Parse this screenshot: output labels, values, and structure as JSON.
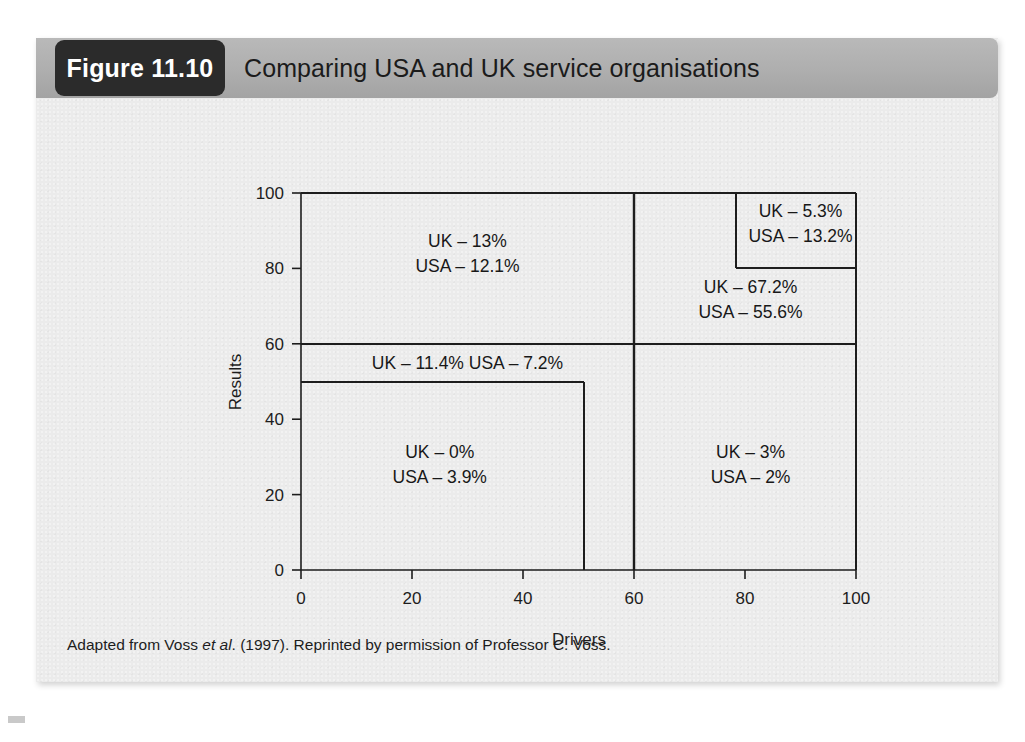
{
  "figure": {
    "tag": "Figure 11.10",
    "title": "Comparing USA and UK service organisations",
    "source_note_prefix": "Adapted from Voss ",
    "source_note_italic": "et al",
    "source_note_suffix": ". (1997). Reprinted by permission of Professor C. Voss."
  },
  "colors": {
    "card_background": "#ebebeb",
    "header_band": "#aeaeae",
    "tag_background": "#2b2b2b",
    "tag_text": "#ffffff",
    "line": "#1d1d1d",
    "text": "#1d1d1d",
    "page_background": "#ffffff"
  },
  "chart_data": {
    "type": "table",
    "title": "Comparing USA and UK service organisations",
    "xlabel": "Drivers",
    "ylabel": "Results",
    "xlim": [
      0,
      100
    ],
    "ylim": [
      0,
      100
    ],
    "xticks": [
      "0",
      "20",
      "40",
      "60",
      "80",
      "100"
    ],
    "yticks": [
      "0",
      "20",
      "40",
      "60",
      "80",
      "100"
    ],
    "xtick_values": [
      0,
      20,
      40,
      60,
      80,
      100
    ],
    "ytick_values": [
      0,
      20,
      40,
      60,
      80,
      100
    ],
    "grid": false,
    "legend": "none",
    "series": [
      {
        "name": "UK",
        "values": [
          13,
          5.3,
          67.2,
          11.4,
          0,
          3
        ]
      },
      {
        "name": "USA",
        "values": [
          12.1,
          13.2,
          55.6,
          7.2,
          3.9,
          2
        ]
      }
    ],
    "categories": [
      "Low drivers / high results",
      "High drivers / very high results (inner box)",
      "High drivers / high results",
      "Mid band (results 50-60)",
      "Low drivers / low results",
      "High drivers / low results"
    ],
    "regions": [
      {
        "id": "top-left",
        "x0": 0,
        "x1": 60,
        "y0": 60,
        "y1": 100,
        "line1": "UK – 13%",
        "line2": "USA – 12.1%",
        "uk": 13,
        "usa": 12.1,
        "label_x": 30,
        "label_y": 84
      },
      {
        "id": "top-right-inner",
        "x0": 80,
        "x1": 100,
        "y0": 80,
        "y1": 100,
        "line1": "UK – 5.3%",
        "line2": "USA – 13.2%",
        "uk": 5.3,
        "usa": 13.2,
        "label_x": 90,
        "label_y": 92
      },
      {
        "id": "top-right-outer",
        "x0": 60,
        "x1": 100,
        "y0": 60,
        "y1": 100,
        "line1": "UK – 67.2%",
        "line2": "USA – 55.6%",
        "uk": 67.2,
        "usa": 55.6,
        "label_x": 81,
        "label_y": 72
      },
      {
        "id": "middle-band",
        "x0": 0,
        "x1": 60,
        "y0": 50,
        "y1": 60,
        "line1": "UK – 11.4% USA – 7.2%",
        "line2": "",
        "uk": 11.4,
        "usa": 7.2,
        "label_x": 30,
        "label_y": 55
      },
      {
        "id": "bottom-left",
        "x0": 0,
        "x1": 50,
        "y0": 0,
        "y1": 50,
        "line1": "UK – 0%",
        "line2": "USA – 3.9%",
        "uk": 0,
        "usa": 3.9,
        "label_x": 25,
        "label_y": 28
      },
      {
        "id": "bottom-right",
        "x0": 60,
        "x1": 100,
        "y0": 0,
        "y1": 60,
        "line1": "UK – 3%",
        "line2": "USA – 2%",
        "uk": 3,
        "usa": 2,
        "label_x": 81,
        "label_y": 28
      }
    ]
  }
}
